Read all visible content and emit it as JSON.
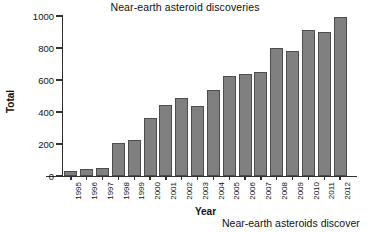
{
  "chart_data": {
    "type": "bar",
    "title": "Near-earth asteroid discoveries",
    "xlabel": "Year",
    "ylabel": "Total",
    "categories": [
      "1995",
      "1996",
      "1997",
      "1998",
      "1999",
      "2000",
      "2001",
      "2002",
      "2003",
      "2004",
      "2005",
      "2006",
      "2007",
      "2008",
      "2009",
      "2010",
      "2011",
      "2012"
    ],
    "values": [
      30,
      45,
      53,
      205,
      228,
      365,
      443,
      485,
      438,
      535,
      627,
      636,
      648,
      800,
      780,
      915,
      898,
      995
    ],
    "ylim": [
      0,
      1000
    ],
    "yticks": [
      0,
      200,
      400,
      600,
      800,
      1000
    ],
    "ytick_labels": [
      "0",
      "200",
      "400",
      "600",
      "800",
      "1000"
    ],
    "grid": false,
    "legend": null,
    "bar_color": "#808080",
    "bar_edge_color": "#4d4d4d",
    "axis_color": "#303030",
    "background_color": "#ffffff"
  },
  "caption": {
    "text": "Near-earth asteroids discover"
  }
}
